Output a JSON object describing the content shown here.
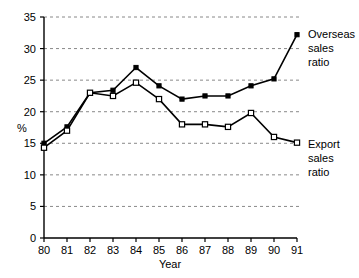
{
  "chart_data": {
    "type": "line",
    "title": "",
    "xlabel": "Year",
    "ylabel": "%",
    "x": [
      "80",
      "81",
      "82",
      "83",
      "84",
      "85",
      "86",
      "87",
      "88",
      "89",
      "90",
      "91"
    ],
    "xlim": [
      0,
      11
    ],
    "ylim": [
      0,
      35
    ],
    "yticks": [
      0,
      5,
      10,
      15,
      20,
      25,
      30,
      35
    ],
    "ytick_labels": [
      "0",
      "5",
      "10",
      "15",
      "20",
      "25",
      "30",
      "35"
    ],
    "grid": "horizontal-dashed",
    "legend_position": "right-inline-annotations",
    "series": [
      {
        "name": "Overseas sales ratio",
        "marker": "filled-square",
        "annotation": [
          "Overseas",
          "sales",
          "ratio"
        ],
        "values": [
          15.0,
          17.6,
          23.0,
          23.4,
          27.0,
          24.1,
          22.0,
          22.5,
          22.5,
          24.1,
          25.2,
          32.2
        ]
      },
      {
        "name": "Export sales ratio",
        "marker": "open-square",
        "annotation": [
          "Export",
          "sales",
          "ratio"
        ],
        "values": [
          14.3,
          17.0,
          23.0,
          22.5,
          24.6,
          22.0,
          18.0,
          18.0,
          17.6,
          19.8,
          16.0,
          15.1
        ]
      }
    ]
  },
  "axis": {
    "y_label": "%",
    "x_label": "Year"
  },
  "colors": {
    "line": "#000000",
    "grid": "#6b6b6b",
    "background": "#ffffff"
  }
}
